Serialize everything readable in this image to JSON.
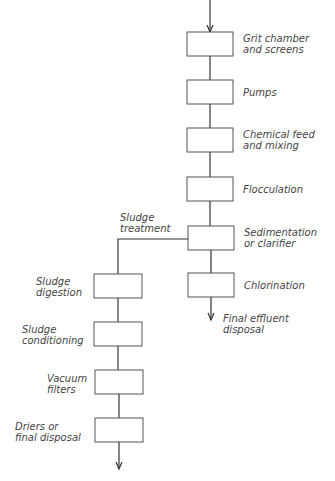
{
  "main_line": {
    "steps": [
      {
        "label": "Grit chamber\nand screens"
      },
      {
        "label": "Pumps"
      },
      {
        "label": "Chemical feed\nand mixing"
      },
      {
        "label": "Flocculation"
      },
      {
        "label": "Sedimentation\nor clarifier"
      },
      {
        "label": "Chlorination"
      }
    ],
    "output_label": "Final effluent\ndisposal"
  },
  "branch": {
    "label": "Sludge\ntreatment",
    "steps": [
      {
        "label": "Sludge\ndigestion"
      },
      {
        "label": "Sludge\nconditioning"
      },
      {
        "label": "Vacuum\nfilters"
      },
      {
        "label": "Driers or\nfinal disposal"
      }
    ]
  },
  "colors": {
    "line": "#333333",
    "box_border": "#555555",
    "text": "#444444"
  }
}
